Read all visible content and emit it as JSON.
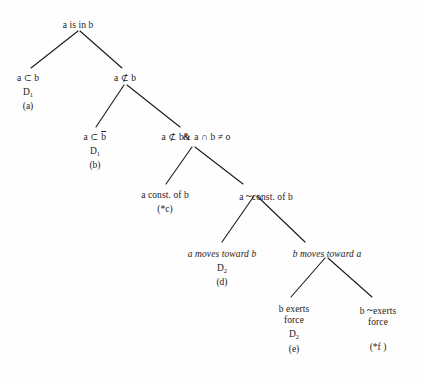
{
  "figure": {
    "type": "tree-diagram",
    "background_color": "#fefefe",
    "line_color": "#1a1a1a",
    "text_color": "#1a1a1a"
  },
  "nodes": {
    "root": {
      "label": "a is in b",
      "x": 78,
      "y": 20
    },
    "a_subset_b": {
      "label": "a ⊂ b",
      "derivation": "D",
      "derivation_index": "1",
      "tag": "(a)",
      "x": 28,
      "y": 73
    },
    "a_notsubset_b": {
      "label": "a ⊄ b",
      "x": 125,
      "y": 73
    },
    "a_subset_bbar": {
      "label_pre": "a ⊂ ",
      "label_over": "b",
      "derivation": "D",
      "derivation_index": "1",
      "tag": "(b)",
      "x": 95,
      "y": 132
    },
    "a_notsubset_and_inter": {
      "label_pre": "a ⊄ b",
      "label_amp": "&",
      "label_post": " a ∩ b ≠ o",
      "x": 196,
      "y": 132
    },
    "a_const_of_b": {
      "label": "a const. of b",
      "tag": "(*c)",
      "x": 165,
      "y": 190
    },
    "a_not_const_of_b": {
      "label_pre": "a ",
      "label_tilde": "~",
      "label_post": "const. of b",
      "x": 266,
      "y": 190
    },
    "a_moves_toward_b": {
      "label": "a moves toward b",
      "derivation": "D",
      "derivation_index": "2",
      "tag": "(d)",
      "x": 222,
      "y": 249
    },
    "b_moves_toward_a": {
      "label": "b moves toward a",
      "x": 327,
      "y": 249
    },
    "b_exerts_force": {
      "label_line1": "b exerts",
      "label_line2": "force",
      "derivation": "D",
      "derivation_index": "2",
      "tag": "(e)",
      "x": 294,
      "y": 304
    },
    "b_not_exerts_force": {
      "label_pre": "b ",
      "label_tilde": "~",
      "label_post": "exerts",
      "label_line2": "force",
      "tag": "(*f )",
      "x": 378,
      "y": 304
    }
  },
  "edges": [
    {
      "name": "root-to-a-subset-b",
      "x1": 78,
      "y1": 31,
      "x2": 31,
      "y2": 68
    },
    {
      "name": "root-to-a-notsubset-b",
      "x1": 80,
      "y1": 31,
      "x2": 122,
      "y2": 68
    },
    {
      "name": "a-notsubset-to-a-subset-bbar",
      "x1": 124,
      "y1": 85,
      "x2": 96,
      "y2": 127
    },
    {
      "name": "a-notsubset-to-and-inter",
      "x1": 127,
      "y1": 85,
      "x2": 180,
      "y2": 127
    },
    {
      "name": "inter-to-a-const",
      "x1": 192,
      "y1": 147,
      "x2": 166,
      "y2": 184
    },
    {
      "name": "inter-to-a-not-const",
      "x1": 195,
      "y1": 147,
      "x2": 243,
      "y2": 184
    },
    {
      "name": "notconst-to-a-moves",
      "x1": 254,
      "y1": 196,
      "x2": 222,
      "y2": 242
    },
    {
      "name": "notconst-to-b-moves",
      "x1": 257,
      "y1": 196,
      "x2": 305,
      "y2": 242
    },
    {
      "name": "bmoves-to-b-exerts",
      "x1": 325,
      "y1": 258,
      "x2": 291,
      "y2": 297
    },
    {
      "name": "bmoves-to-b-not-exerts",
      "x1": 328,
      "y1": 258,
      "x2": 372,
      "y2": 297
    }
  ]
}
